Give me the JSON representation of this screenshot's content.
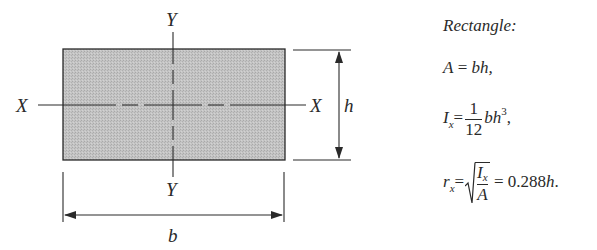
{
  "figure": {
    "type": "rectangle-cross-section",
    "fill_color": "#bdbdbd",
    "stroke_color": "#2a2a2a",
    "axis_labels": {
      "x_left": "X",
      "x_right": "X",
      "y_top": "Y",
      "y_bottom": "Y"
    },
    "dimensions": {
      "width_label": "b",
      "height_label": "h"
    }
  },
  "formulas": {
    "title": "Rectangle:",
    "area": {
      "lhs": "A",
      "eq": "=",
      "rhs": "bh,"
    },
    "inertia": {
      "lhs": "I",
      "lhs_sub": "x",
      "eq": "=",
      "frac_num": "1",
      "frac_den": "12",
      "rhs_base": "bh",
      "rhs_exp": "3",
      "trail": ","
    },
    "gyration": {
      "lhs": "r",
      "lhs_sub": "x",
      "eq": "=",
      "sqrt_num": "I",
      "sqrt_num_sub": "x",
      "sqrt_den": "A",
      "eq2": "=",
      "value": "0.288",
      "value_var": "h",
      "trail": "."
    }
  }
}
